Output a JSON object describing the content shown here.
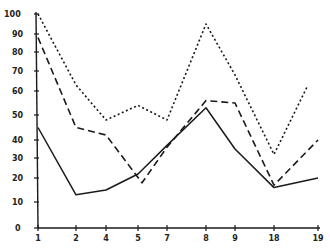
{
  "chart_data": {
    "type": "line",
    "title": "",
    "xlabel": "",
    "ylabel": "",
    "x": [
      "1",
      "2",
      "4",
      "5",
      "7",
      "8",
      "9",
      "18",
      "19"
    ],
    "ylim": [
      0,
      100
    ],
    "yticks": [
      0,
      10,
      20,
      30,
      40,
      50,
      60,
      70,
      80,
      90,
      100
    ],
    "grid": false,
    "legend": null,
    "series": [
      {
        "name": "solid",
        "style": "solid",
        "values": [
          45,
          13,
          15,
          22,
          37,
          53,
          35,
          16,
          20
        ]
      },
      {
        "name": "dashed",
        "style": "dashed",
        "values": [
          88,
          45,
          42,
          18,
          36,
          56,
          55,
          17,
          40
        ]
      },
      {
        "name": "dotted",
        "style": "dotted",
        "values": [
          100,
          63,
          48,
          54,
          48,
          95,
          68,
          32,
          62
        ]
      }
    ]
  },
  "colors": {
    "line": "#1a1a1a",
    "axis": "#1a1a1a",
    "background": "#ffffff"
  }
}
